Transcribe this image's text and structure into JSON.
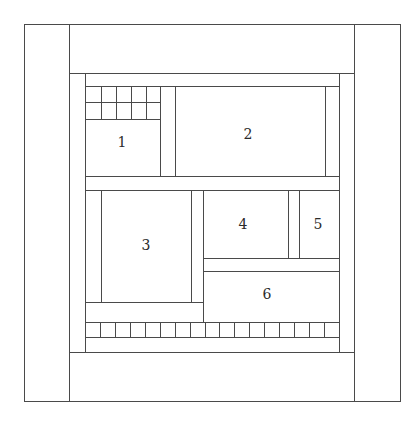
{
  "diagram": {
    "type": "quilt-block-layout",
    "line_color": "#4a4a4a",
    "background": "#ffffff",
    "panels": [
      {
        "id": "1",
        "label": "1",
        "x": 85,
        "y": 119,
        "w": 75,
        "h": 57,
        "label_x": 122,
        "label_y": 142
      },
      {
        "id": "2",
        "label": "2",
        "x": 175,
        "y": 86,
        "w": 150,
        "h": 90,
        "label_x": 248,
        "label_y": 134
      },
      {
        "id": "3",
        "label": "3",
        "x": 101,
        "y": 190,
        "w": 90,
        "h": 112,
        "label_x": 146,
        "label_y": 245
      },
      {
        "id": "4",
        "label": "4",
        "x": 203,
        "y": 190,
        "w": 85,
        "h": 68,
        "label_x": 243,
        "label_y": 224
      },
      {
        "id": "5",
        "label": "5",
        "x": 299,
        "y": 190,
        "w": 40,
        "h": 68,
        "label_x": 318,
        "label_y": 224
      },
      {
        "id": "6",
        "label": "6",
        "x": 203,
        "y": 271,
        "w": 136,
        "h": 50,
        "label_x": 267,
        "label_y": 294
      }
    ],
    "top_grid": {
      "columns": 5,
      "rows": 2,
      "x": 85,
      "y": 86,
      "w": 75,
      "h": 33
    },
    "bottom_strip": {
      "tiles": 17,
      "x": 85,
      "y": 322,
      "w": 254,
      "h": 15
    }
  }
}
